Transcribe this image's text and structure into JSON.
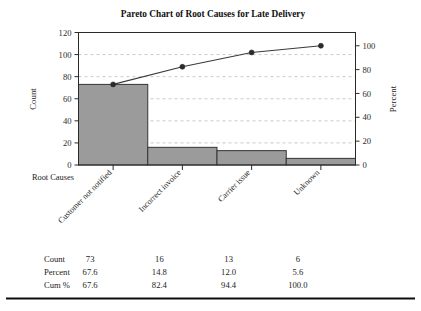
{
  "chart_data": {
    "type": "bar",
    "title": "Pareto Chart of Root Causes for Late Delivery",
    "categories": [
      "Customer not notified",
      "Incorrect invoice",
      "Carrier issue",
      "Unknown"
    ],
    "values": [
      73,
      16,
      13,
      6
    ],
    "series": [
      {
        "name": "Count",
        "values": [
          73,
          16,
          13,
          6
        ]
      },
      {
        "name": "Percent",
        "values": [
          67.6,
          14.8,
          12.0,
          5.6
        ]
      },
      {
        "name": "Cum %",
        "values": [
          67.6,
          82.4,
          94.4,
          100.0
        ]
      }
    ],
    "xlabel": "Root Causes",
    "ylabel": "Count",
    "y2label": "Percent",
    "ylim": [
      0,
      120
    ],
    "y2lim": [
      0,
      100
    ],
    "yticks": [
      0,
      20,
      40,
      60,
      80,
      100,
      120
    ],
    "y2ticks": [
      0,
      20,
      40,
      60,
      80,
      100
    ],
    "grid": true,
    "legend": "none",
    "total_count": 108
  },
  "table": {
    "rows": [
      {
        "label": "Count",
        "values": [
          "73",
          "16",
          "13",
          "6"
        ]
      },
      {
        "label": "Percent",
        "values": [
          "67.6",
          "14.8",
          "12.0",
          "5.6"
        ]
      },
      {
        "label": "Cum %",
        "values": [
          "67.6",
          "82.4",
          "94.4",
          "100.0"
        ]
      }
    ]
  },
  "axis": {
    "y_ticklabels": [
      "0",
      "20",
      "40",
      "60",
      "80",
      "100",
      "120"
    ],
    "y2_ticklabels": [
      "0",
      "20",
      "40",
      "60",
      "80",
      "100"
    ],
    "y_title": "Count",
    "y2_title": "Percent",
    "x_title": "Root Causes"
  },
  "colors": {
    "bar_fill": "#9b9b9b",
    "bar_stroke": "#343434",
    "line": "#3a3a3a",
    "marker": "#2b2b2b",
    "grid": "#b9bcc4",
    "axis": "#2a2a2a",
    "background": "#ffffff"
  }
}
